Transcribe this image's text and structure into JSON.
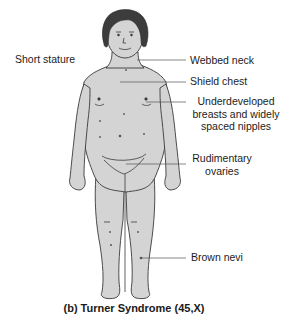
{
  "diagram": {
    "title": "(b) Turner Syndrome (45,X)",
    "colors": {
      "skin": "#d4d4d4",
      "outline": "#3a3a3a",
      "hair": "#3c3c3c",
      "leader_line": "#555555",
      "text": "#1c1c1c"
    },
    "labels": {
      "short_stature": "Short stature",
      "webbed_neck": "Webbed neck",
      "shield_chest": "Shield chest",
      "breasts_line1": "Underdeveloped",
      "breasts_line2": "breasts and widely",
      "breasts_line3": "spaced nipples",
      "ovaries_line1": "Rudimentary",
      "ovaries_line2": "ovaries",
      "brown_nevi": "Brown nevi"
    }
  }
}
